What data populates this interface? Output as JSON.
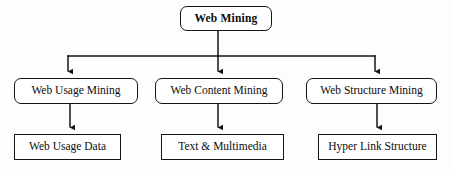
{
  "diagram": {
    "style": {
      "line_color": "#141414",
      "box_fill": "#ffffff",
      "text_color": "#0d0d0d",
      "background": "#fdfdfc"
    },
    "root": {
      "label": "Web Mining",
      "shape": "rounded-rectangle",
      "bold": true,
      "box": {
        "x": 180,
        "y": 6,
        "w": 92,
        "h": 25
      }
    },
    "branches": [
      {
        "id": "web-usage-mining",
        "label": "Web Usage Mining",
        "shape": "rounded-rectangle",
        "box": {
          "x": 14,
          "y": 78,
          "w": 124,
          "h": 26
        },
        "child": {
          "id": "web-usage-data",
          "label": "Web Usage Data",
          "shape": "rectangle",
          "box": {
            "x": 14,
            "y": 134,
            "w": 107,
            "h": 26
          }
        }
      },
      {
        "id": "web-content-mining",
        "label": "Web Content Mining",
        "shape": "rounded-rectangle",
        "box": {
          "x": 155,
          "y": 78,
          "w": 128,
          "h": 26
        },
        "child": {
          "id": "text-and-multimedia",
          "label": "Text & Multimedia",
          "shape": "rectangle",
          "box": {
            "x": 161,
            "y": 134,
            "w": 123,
            "h": 26
          }
        }
      },
      {
        "id": "web-structure-mining",
        "label": "Web Structure Mining",
        "shape": "rounded-rectangle",
        "box": {
          "x": 306,
          "y": 78,
          "w": 131,
          "h": 26
        },
        "child": {
          "id": "hyper-link-structure",
          "label": "Hyper Link Structure",
          "shape": "rectangle",
          "box": {
            "x": 318,
            "y": 134,
            "w": 119,
            "h": 26
          }
        }
      }
    ],
    "connectors": {
      "root_stem": {
        "x": 218,
        "y1": 31,
        "y2": 56
      },
      "bus": {
        "y": 56,
        "x1": 68,
        "x2": 375
      },
      "branch_arrows": [
        {
          "x": 68,
          "y1": 56,
          "y2": 78
        },
        {
          "x": 218,
          "y1": 56,
          "y2": 78
        },
        {
          "x": 375,
          "y1": 56,
          "y2": 78
        }
      ],
      "leaf_arrows": [
        {
          "x": 70,
          "y1": 104,
          "y2": 134
        },
        {
          "x": 218,
          "y1": 104,
          "y2": 134
        },
        {
          "x": 377,
          "y1": 104,
          "y2": 134
        }
      ]
    }
  }
}
